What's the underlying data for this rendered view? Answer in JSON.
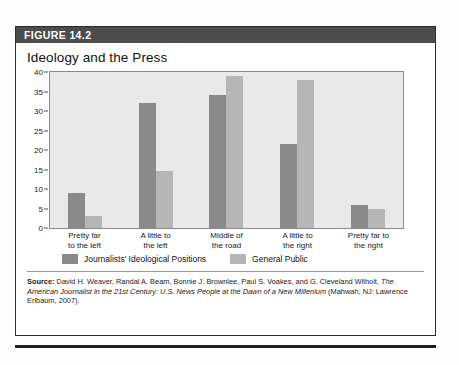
{
  "figure": {
    "banner_label": "FIGURE 14.2",
    "title": "Ideology and the Press"
  },
  "colors": {
    "banner_background": "#4c4c4c",
    "plot_background": "#e9e9e9",
    "series_0": "#8a8a8a",
    "series_1": "#b6b6b6"
  },
  "source": {
    "lead_label": "Source:",
    "line1": " David H. Weaver, Randal A. Beam, Bonnie J. Brownlee, Paul S. Voakes, and G. Cleveland Wilhoit,",
    "line2_italic": "The American Journalist in the 21st Century: U.S. News People at the Dawn of a New Millenium",
    "line2_tail": " (Mahwah,",
    "line3": "NJ: Lawrence Erlbaum, 2007)."
  },
  "chart_data": {
    "type": "bar",
    "title": "Ideology and the Press",
    "xlabel": "",
    "ylabel": "",
    "ylim": [
      0,
      40
    ],
    "yticks": [
      0,
      5,
      10,
      15,
      20,
      25,
      30,
      35,
      40
    ],
    "grid": false,
    "legend_position": "bottom-left",
    "categories": [
      "Pretty far to the left",
      "A little to the left",
      "Middle of the road",
      "A little to the right",
      "Pretty far to the right"
    ],
    "category_lines": [
      [
        "Pretty far",
        "to the left"
      ],
      [
        "A little to",
        "the left"
      ],
      [
        "Middle of",
        "the road"
      ],
      [
        "A little to",
        "the right"
      ],
      [
        "Pretty far to",
        "the right"
      ]
    ],
    "series": [
      {
        "name": "Journalists' Ideological Positions",
        "color": "#8a8a8a",
        "values": [
          9,
          32,
          34,
          21.5,
          6
        ]
      },
      {
        "name": "General Public",
        "color": "#b6b6b6",
        "values": [
          3,
          14.5,
          39,
          38,
          5
        ]
      }
    ]
  }
}
